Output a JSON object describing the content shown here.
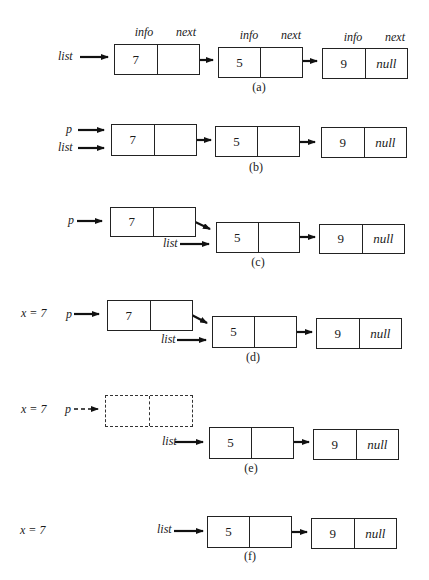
{
  "figure": {
    "headers": {
      "info": "info",
      "next": "next"
    },
    "null_label": "null",
    "panels": [
      {
        "id": "a",
        "caption": "(a)",
        "pointers": [
          "list"
        ],
        "nodes": [
          {
            "info": "7",
            "next": ""
          },
          {
            "info": "5",
            "next": ""
          },
          {
            "info": "9",
            "next": "null"
          }
        ]
      },
      {
        "id": "b",
        "caption": "(b)",
        "pointers": [
          "p",
          "list"
        ],
        "nodes": [
          {
            "info": "7",
            "next": ""
          },
          {
            "info": "5",
            "next": ""
          },
          {
            "info": "9",
            "next": "null"
          }
        ]
      },
      {
        "id": "c",
        "caption": "(c)",
        "pointers": [
          "p",
          "list"
        ],
        "nodes": [
          {
            "info": "7",
            "next": ""
          },
          {
            "info": "5",
            "next": ""
          },
          {
            "info": "9",
            "next": "null"
          }
        ]
      },
      {
        "id": "d",
        "caption": "(d)",
        "variable": "x = 7",
        "pointers": [
          "p",
          "list"
        ],
        "nodes": [
          {
            "info": "7",
            "next": ""
          },
          {
            "info": "5",
            "next": ""
          },
          {
            "info": "9",
            "next": "null"
          }
        ]
      },
      {
        "id": "e",
        "caption": "(e)",
        "variable": "x = 7",
        "pointers": [
          "p",
          "list"
        ],
        "freed_node": {
          "info": "",
          "next": ""
        },
        "nodes": [
          {
            "info": "5",
            "next": ""
          },
          {
            "info": "9",
            "next": "null"
          }
        ]
      },
      {
        "id": "f",
        "caption": "(f)",
        "variable": "x = 7",
        "pointers": [
          "list"
        ],
        "nodes": [
          {
            "info": "5",
            "next": ""
          },
          {
            "info": "9",
            "next": "null"
          }
        ]
      }
    ]
  }
}
